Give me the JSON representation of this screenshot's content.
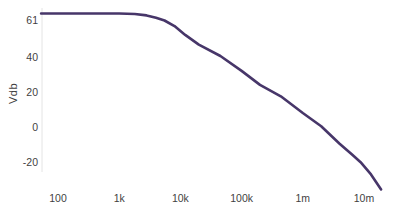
{
  "chart_data": {
    "type": "line",
    "title": "",
    "xlabel": "",
    "ylabel": "Vdb",
    "x_scale": "log",
    "grid": false,
    "legend": "none",
    "x_range_hz": [
      50,
      20000000
    ],
    "y_range_db": [
      -38,
      66
    ],
    "x_ticks": [
      {
        "label": "100",
        "value": 100
      },
      {
        "label": "1k",
        "value": 1000
      },
      {
        "label": "10k",
        "value": 10000
      },
      {
        "label": "100k",
        "value": 100000
      },
      {
        "label": "1m",
        "value": 1000000
      },
      {
        "label": "10m",
        "value": 10000000
      }
    ],
    "y_ticks": [
      {
        "label": "61",
        "value": 61
      },
      {
        "label": "40",
        "value": 40
      },
      {
        "label": "20",
        "value": 20
      },
      {
        "label": "0",
        "value": 0
      },
      {
        "label": "-20",
        "value": -20
      }
    ],
    "series": [
      {
        "name": "gain-magnitude",
        "color": "#473669",
        "points_hz_db": [
          [
            53,
            64.7
          ],
          [
            1000,
            64.7
          ],
          [
            1800,
            64.4
          ],
          [
            2800,
            63.6
          ],
          [
            4000,
            62.3
          ],
          [
            5500,
            60.7
          ],
          [
            8000,
            57.5
          ],
          [
            12000,
            52.5
          ],
          [
            20000,
            47
          ],
          [
            45000,
            40.5
          ],
          [
            100000,
            32
          ],
          [
            200000,
            24
          ],
          [
            437000,
            17.5
          ],
          [
            1000000,
            8
          ],
          [
            2000000,
            0.5
          ],
          [
            4000000,
            -9.5
          ],
          [
            6500000,
            -16
          ],
          [
            8800000,
            -20
          ],
          [
            13000000,
            -27
          ],
          [
            19000000,
            -35.5
          ]
        ]
      }
    ],
    "axis_line_color": "#e4e4e4"
  }
}
